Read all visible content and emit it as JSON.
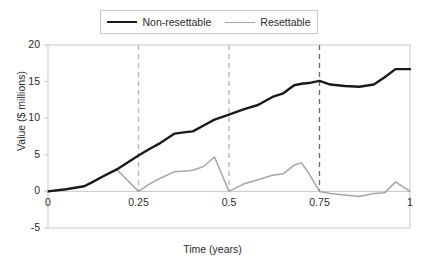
{
  "chart_data": {
    "type": "line",
    "title": "",
    "xlabel": "Time (years)",
    "ylabel": "Value ($ millions)",
    "xlim": [
      0,
      1
    ],
    "ylim": [
      -5,
      20
    ],
    "xticks": [
      "0",
      "0.25",
      "0.5",
      "0.75",
      "1"
    ],
    "xtick_values": [
      0,
      0.25,
      0.5,
      0.75,
      1
    ],
    "yticks": [
      "20",
      "15",
      "10",
      "5",
      "0",
      "-5"
    ],
    "ytick_values": [
      20,
      15,
      10,
      5,
      0,
      -5
    ],
    "grid": false,
    "legend_position": "top-center",
    "colors": {
      "non_resettable": "#1a1a1a",
      "resettable": "#a6a6a6",
      "reset_line_light": "#b5b5b5",
      "reset_line_dark": "#6b6b6b",
      "axis": "#c9c9c9"
    },
    "annotations": {
      "reset_lines": [
        0.25,
        0.5,
        0.75
      ],
      "reset_line_labels": [
        "0.25",
        "0.5",
        "0.75"
      ]
    },
    "series": [
      {
        "name": "Non-resettable",
        "color": "#1a1a1a",
        "x": [
          0.0,
          0.05,
          0.1,
          0.12,
          0.15,
          0.19,
          0.25,
          0.28,
          0.31,
          0.35,
          0.38,
          0.4,
          0.43,
          0.46,
          0.5,
          0.54,
          0.58,
          0.62,
          0.65,
          0.68,
          0.7,
          0.72,
          0.75,
          0.78,
          0.82,
          0.86,
          0.9,
          0.93,
          0.96,
          1.0
        ],
        "values": [
          0.0,
          0.3,
          0.7,
          1.2,
          2.0,
          3.0,
          4.9,
          5.8,
          6.6,
          7.9,
          8.1,
          8.2,
          9.0,
          9.8,
          10.5,
          11.2,
          11.8,
          12.9,
          13.4,
          14.5,
          14.7,
          14.8,
          15.1,
          14.6,
          14.4,
          14.3,
          14.6,
          15.6,
          16.7,
          16.7
        ]
      },
      {
        "name": "Resettable",
        "color": "#a6a6a6",
        "x": [
          0.0,
          0.05,
          0.1,
          0.12,
          0.15,
          0.19,
          0.25,
          0.25,
          0.28,
          0.31,
          0.35,
          0.38,
          0.4,
          0.43,
          0.46,
          0.5,
          0.5,
          0.54,
          0.58,
          0.62,
          0.65,
          0.68,
          0.7,
          0.72,
          0.75,
          0.75,
          0.78,
          0.82,
          0.86,
          0.9,
          0.93,
          0.96,
          1.0
        ],
        "values": [
          0.0,
          0.3,
          0.7,
          1.2,
          2.0,
          3.0,
          0.0,
          0.0,
          1.0,
          1.8,
          2.7,
          2.8,
          2.9,
          3.4,
          4.7,
          0.0,
          0.0,
          1.0,
          1.6,
          2.2,
          2.4,
          3.6,
          3.9,
          2.5,
          0.0,
          0.0,
          -0.3,
          -0.5,
          -0.7,
          -0.3,
          -0.2,
          1.3,
          0.0
        ]
      }
    ]
  },
  "legend": {
    "items": [
      {
        "label": "Non-resettable"
      },
      {
        "label": "Resettable"
      }
    ]
  }
}
